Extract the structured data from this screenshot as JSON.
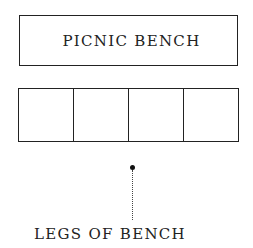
{
  "diagram": {
    "title_box": {
      "label": "PICNIC BENCH"
    },
    "grid": {
      "cell_count": 4
    },
    "annotation": {
      "label": "LEGS OF BENCH",
      "marker": "dot",
      "connector": "dotted-line"
    }
  }
}
